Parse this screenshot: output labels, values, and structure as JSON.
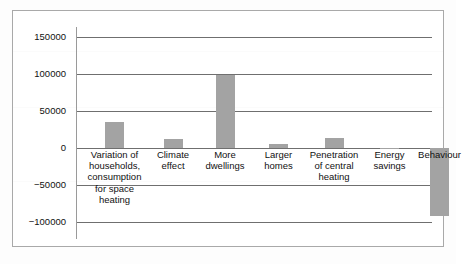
{
  "chart_data": {
    "type": "bar",
    "title": "",
    "xlabel": "",
    "ylabel": "",
    "categories": [
      "Variation of\nhouseholds,\nconsumption\nfor space\nheating",
      "Climate\neffect",
      "More\ndwellings",
      "Larger\nhomes",
      "Penetration\nof central\nheating",
      "Energy\nsavings",
      "Behaviour"
    ],
    "values": [
      35000,
      12000,
      98000,
      6000,
      13000,
      -2000,
      -92000
    ],
    "ylim": [
      -100000,
      150000
    ],
    "yticks": [
      150000,
      100000,
      50000,
      0,
      -50000,
      -100000
    ],
    "ytick_labels": [
      "150000",
      "100000",
      "50000",
      "0",
      "−50000",
      "−100000"
    ],
    "grid": true,
    "legend": "none",
    "bar_color": "#a3a3a3",
    "axis_color": "#6f6f6f",
    "frame_color": "#a9a9a9"
  }
}
